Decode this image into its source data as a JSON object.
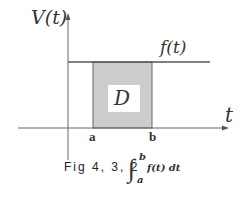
{
  "diagram": {
    "y_axis_label": "V(t)",
    "x_axis_label": "t",
    "function_label": "f(t)",
    "region_label": "D",
    "tick_a": "a",
    "tick_b": "b",
    "caption": "Fig 4, 3, 2",
    "integral": {
      "lower": "a",
      "upper": "b",
      "integrand": "f(t) dt"
    },
    "colors": {
      "region_fill": "#cccccc",
      "lines": "#555555",
      "label_box": "#ffffff"
    }
  }
}
